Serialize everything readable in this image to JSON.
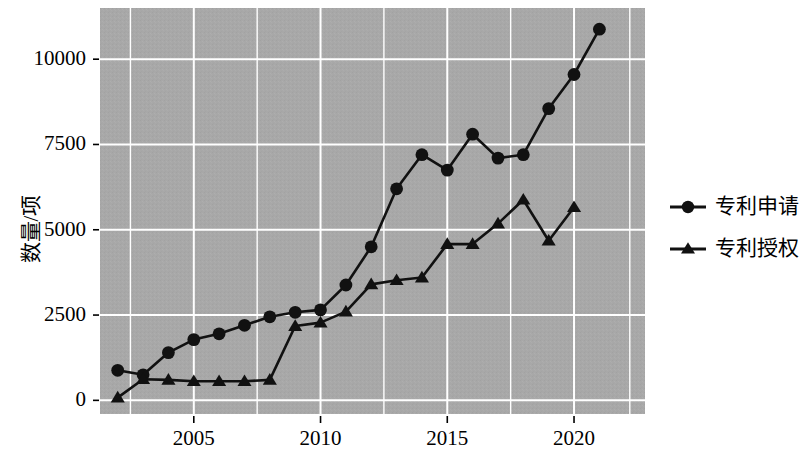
{
  "chart_data": {
    "type": "line",
    "title": "",
    "subtitle": "",
    "xlabel": "",
    "ylabel": "数量/项",
    "x": [
      2002,
      2003,
      2004,
      2005,
      2006,
      2007,
      2008,
      2009,
      2010,
      2011,
      2012,
      2013,
      2014,
      2015,
      2016,
      2017,
      2018,
      2019,
      2020,
      2021,
      2022
    ],
    "xlim": [
      2001.3,
      2022.8
    ],
    "ylim": [
      -400,
      11500
    ],
    "xticks": [
      2005,
      2010,
      2015,
      2020
    ],
    "xtick_labels": [
      "2005",
      "2010",
      "2015",
      "2020"
    ],
    "yticks": [
      0,
      2500,
      5000,
      7500,
      10000
    ],
    "ytick_labels": [
      "0",
      "2500",
      "5000",
      "7500",
      "10000"
    ],
    "grid": true,
    "grid_color": "#ffffff",
    "plot_bgcolor": "#a8a8a8",
    "legend_position": "right",
    "series": [
      {
        "name": "专利申请",
        "marker": "circle",
        "color": "#111111",
        "values": [
          880,
          750,
          1400,
          1780,
          1950,
          2200,
          2450,
          2580,
          2650,
          3380,
          4500,
          6200,
          7200,
          6750,
          7800,
          7100,
          7200,
          8550,
          9550,
          10880,
          null
        ]
      },
      {
        "name": "专利授权",
        "marker": "triangle",
        "color": "#111111",
        "values": [
          80,
          620,
          600,
          560,
          560,
          560,
          600,
          2180,
          2280,
          2600,
          3400,
          3520,
          3600,
          4580,
          4580,
          5180,
          5880,
          4680,
          5660,
          null,
          null
        ]
      }
    ]
  },
  "legend": {
    "entries": [
      {
        "label": "专利申请",
        "marker": "circle"
      },
      {
        "label": "专利授权",
        "marker": "triangle"
      }
    ]
  }
}
